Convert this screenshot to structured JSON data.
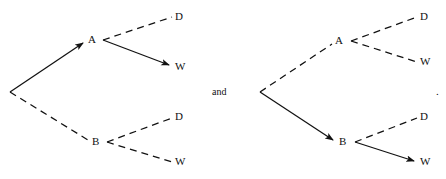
{
  "figure": {
    "type": "decision-tree-pair",
    "conjunction": "and",
    "terminator": ".",
    "stroke_color": "#111111",
    "background_color": "#ffffff"
  },
  "trees": [
    {
      "id": "left-tree",
      "root": {
        "x": 10,
        "y": 92,
        "label": ""
      },
      "nodes": [
        {
          "id": "left-A",
          "label": "A",
          "x": 91,
          "y": 40,
          "branch_x": 103,
          "branch_y": 40
        },
        {
          "id": "left-B",
          "label": "B",
          "x": 95,
          "y": 142,
          "branch_x": 107,
          "branch_y": 142
        }
      ],
      "leaves": [
        {
          "id": "left-A-D",
          "label": "D",
          "x": 177,
          "y": 17
        },
        {
          "id": "left-A-W",
          "label": "W",
          "x": 177,
          "y": 67
        },
        {
          "id": "left-B-D",
          "label": "D",
          "x": 177,
          "y": 117
        },
        {
          "id": "left-B-W",
          "label": "W",
          "x": 177,
          "y": 162
        }
      ],
      "edges": [
        {
          "id": "left-root-A",
          "from": "root",
          "to": "A",
          "style": "solid",
          "arrow": true
        },
        {
          "id": "left-root-B",
          "from": "root",
          "to": "B",
          "style": "dashed",
          "arrow": false
        },
        {
          "id": "left-A-D",
          "from": "A",
          "to": "D",
          "style": "dashed",
          "arrow": false
        },
        {
          "id": "left-A-W",
          "from": "A",
          "to": "W",
          "style": "solid",
          "arrow": true
        },
        {
          "id": "left-B-D",
          "from": "B",
          "to": "D",
          "style": "dashed",
          "arrow": false
        },
        {
          "id": "left-B-W",
          "from": "B",
          "to": "W",
          "style": "dashed",
          "arrow": false
        }
      ]
    },
    {
      "id": "right-tree",
      "root": {
        "x": 260,
        "y": 92,
        "label": ""
      },
      "nodes": [
        {
          "id": "right-A",
          "label": "A",
          "x": 338,
          "y": 41,
          "branch_x": 351,
          "branch_y": 41
        },
        {
          "id": "right-B",
          "label": "B",
          "x": 342,
          "y": 142,
          "branch_x": 355,
          "branch_y": 142
        }
      ],
      "leaves": [
        {
          "id": "right-A-D",
          "label": "D",
          "x": 422,
          "y": 17
        },
        {
          "id": "right-A-W",
          "label": "W",
          "x": 422,
          "y": 62
        },
        {
          "id": "right-B-D",
          "label": "D",
          "x": 422,
          "y": 117
        },
        {
          "id": "right-B-W",
          "label": "W",
          "x": 422,
          "y": 162
        }
      ],
      "edges": [
        {
          "id": "right-root-A",
          "from": "root",
          "to": "A",
          "style": "dashed",
          "arrow": false
        },
        {
          "id": "right-root-B",
          "from": "root",
          "to": "B",
          "style": "solid",
          "arrow": true
        },
        {
          "id": "right-A-D",
          "from": "A",
          "to": "D",
          "style": "dashed",
          "arrow": false
        },
        {
          "id": "right-A-W",
          "from": "A",
          "to": "W",
          "style": "dashed",
          "arrow": false
        },
        {
          "id": "right-B-D",
          "from": "B",
          "to": "D",
          "style": "dashed",
          "arrow": false
        },
        {
          "id": "right-B-W",
          "from": "B",
          "to": "W",
          "style": "solid",
          "arrow": true
        }
      ]
    }
  ],
  "labels": {
    "left_A": "A",
    "left_B": "B",
    "left_A_D": "D",
    "left_A_W": "W",
    "left_B_D": "D",
    "left_B_W": "W",
    "right_A": "A",
    "right_B": "B",
    "right_A_D": "D",
    "right_A_W": "W",
    "right_B_D": "D",
    "right_B_W": "W",
    "conjunction": "and",
    "period": "."
  }
}
